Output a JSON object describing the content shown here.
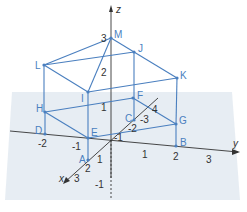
{
  "diagram": {
    "title": "",
    "axes": {
      "x": {
        "label": "x",
        "ticks": [
          "1",
          "2",
          "3",
          "-1",
          "-2",
          "-3",
          "4"
        ]
      },
      "y": {
        "label": "y",
        "ticks": [
          "-2",
          "-1",
          "1",
          "2",
          "3"
        ]
      },
      "z": {
        "label": "z",
        "ticks": [
          "3",
          "2",
          "1",
          "-1"
        ]
      }
    },
    "points": {
      "A": "A",
      "B": "B",
      "C": "C",
      "D": "D",
      "E": "E",
      "F": "F",
      "G": "G",
      "H": "H",
      "I": "I",
      "J": "J",
      "K": "K",
      "L": "L",
      "M": "M"
    },
    "colors": {
      "edge": "#4a7fbf",
      "plane": "#dde6ee",
      "axis": "#333333"
    }
  }
}
